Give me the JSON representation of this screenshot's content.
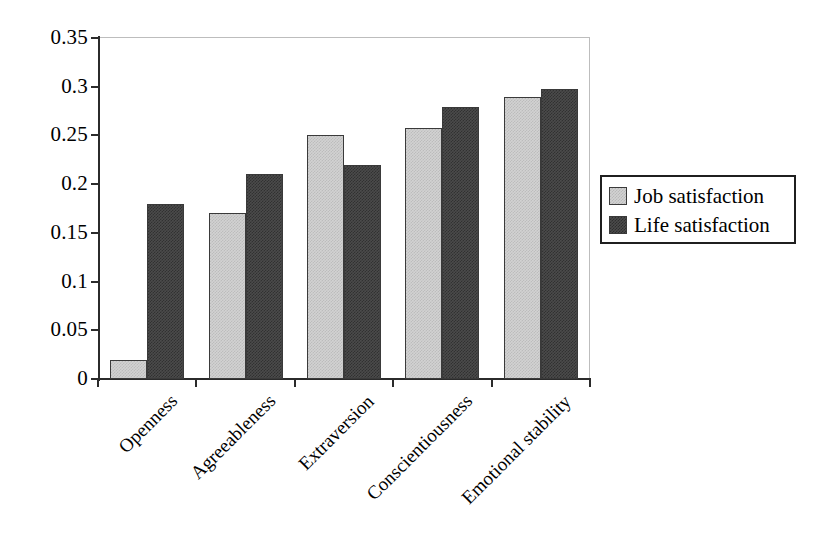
{
  "chart_data": {
    "type": "bar",
    "title": "",
    "subtitle": "",
    "xlabel": "",
    "ylabel": "",
    "categories": [
      "Openness",
      "Agreeableness",
      "Extraversion",
      "Conscientiousness",
      "Emotional stability"
    ],
    "series": [
      {
        "name": "Job satisfaction",
        "values": [
          0.02,
          0.17,
          0.25,
          0.258,
          0.289
        ],
        "color": "#d2d2d2"
      },
      {
        "name": "Life satisfaction",
        "values": [
          0.18,
          0.21,
          0.22,
          0.279,
          0.298
        ],
        "color": "#4b4b4b"
      }
    ],
    "ylim": [
      0,
      0.35
    ],
    "ytick_values": [
      0,
      0.05,
      0.1,
      0.15,
      0.2,
      0.25,
      0.3,
      0.35
    ],
    "ytick_labels": [
      "0",
      "0.05",
      "0.1",
      "0.15",
      "0.2",
      "0.25",
      "0.3",
      "0.35"
    ],
    "grid": false,
    "legend_position": "right",
    "xtick_label_rotation": -45,
    "annotations": []
  },
  "legend": {
    "items": [
      {
        "label": "Job satisfaction",
        "swatch": "light-gray-swatch"
      },
      {
        "label": "Life satisfaction",
        "swatch": "dark-gray-swatch"
      }
    ]
  }
}
